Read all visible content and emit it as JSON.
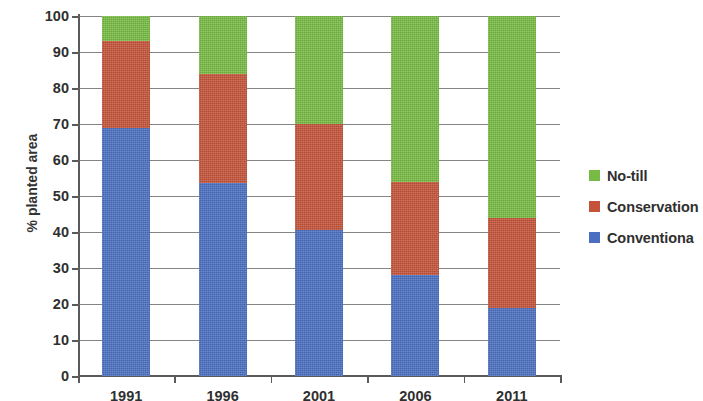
{
  "chart_data": {
    "type": "bar",
    "subtype": "stacked-bar-100",
    "title": "",
    "xlabel": "",
    "ylabel": "% planted area",
    "categories": [
      "1991",
      "1996",
      "2001",
      "2006",
      "2011"
    ],
    "ylim": [
      0,
      100
    ],
    "yticks": [
      0,
      10,
      20,
      30,
      40,
      50,
      60,
      70,
      80,
      90,
      100
    ],
    "ytick_labels": [
      "0",
      "10",
      "20",
      "30",
      "40",
      "50",
      "60",
      "70",
      "80",
      "90",
      "100"
    ],
    "grid": true,
    "grid_axis": "y",
    "legend_position": "right",
    "stack_order_bottom_to_top": [
      "Conventional",
      "Conservation",
      "No-till"
    ],
    "series": [
      {
        "name": "Conventional",
        "legend_label": "Conventiona",
        "color": "#4a6fc0",
        "values": [
          69,
          53.5,
          40.5,
          28,
          19
        ]
      },
      {
        "name": "Conservation",
        "legend_label": "Conservation",
        "color": "#c4533a",
        "values": [
          24,
          30.5,
          29.5,
          26,
          25
        ]
      },
      {
        "name": "No-till",
        "legend_label": "No-till",
        "color": "#77bb44",
        "values": [
          7,
          16,
          30,
          46,
          56
        ]
      }
    ],
    "cumulative_tops": {
      "Conventional": [
        69,
        53.5,
        40.5,
        28,
        19
      ],
      "Conservation": [
        93,
        84,
        70,
        54,
        44
      ],
      "No-till": [
        100,
        100,
        100,
        100,
        100
      ]
    }
  },
  "legend": {
    "items": [
      {
        "label": "No-till",
        "color": "#77bb44"
      },
      {
        "label": "Conservation",
        "color": "#c4533a"
      },
      {
        "label": "Conventiona",
        "color": "#4a6fc0"
      }
    ]
  },
  "axes": {
    "y_title": "% planted area"
  }
}
